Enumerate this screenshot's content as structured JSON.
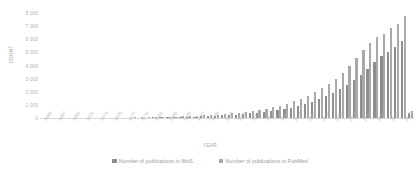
{
  "chart_data": {
    "type": "bar",
    "title": "",
    "xlabel": "YEAR",
    "ylabel": "COUNT",
    "ylim": [
      0,
      8000
    ],
    "ytick_values": [
      0,
      1000,
      2000,
      3000,
      4000,
      5000,
      6000,
      7000,
      8000
    ],
    "ytick_labels": [
      "0",
      "1 000",
      "2 000",
      "3 000",
      "4 000",
      "5 000",
      "6 000",
      "7 000",
      "8 000"
    ],
    "grid": false,
    "legend_position": "bottom",
    "categories": [
      "1965",
      "1966",
      "1967",
      "1968",
      "1969",
      "1970",
      "1971",
      "1972",
      "1973",
      "1974",
      "1975",
      "1976",
      "1977",
      "1978",
      "1979",
      "1980",
      "1981",
      "1982",
      "1983",
      "1984",
      "1985",
      "1986",
      "1987",
      "1988",
      "1989",
      "1990",
      "1991",
      "1992",
      "1993",
      "1994",
      "1995",
      "1996",
      "1997",
      "1998",
      "1999",
      "2000",
      "2001",
      "2002",
      "2003",
      "2004",
      "2005",
      "2006",
      "2007",
      "2008",
      "2009",
      "2010",
      "2011",
      "2012",
      "2013",
      "2014",
      "2015",
      "2016",
      "2017",
      "2018"
    ],
    "xtick_labels": [
      "1965",
      "1967",
      "1969",
      "1971",
      "1973",
      "1975",
      "1977",
      "1979",
      "1981",
      "1983",
      "1985",
      "1987",
      "1989",
      "1991",
      "1993",
      "1995",
      "1997",
      "1999",
      "2001",
      "2003",
      "2005",
      "2007",
      "2009",
      "2011",
      "2013",
      "2015",
      "2017"
    ],
    "series": [
      {
        "name": "Number of publications in WoS",
        "color": "#8e8e8e",
        "values": [
          2,
          3,
          4,
          5,
          6,
          8,
          9,
          11,
          13,
          15,
          18,
          21,
          24,
          28,
          33,
          38,
          45,
          52,
          60,
          70,
          82,
          95,
          110,
          128,
          148,
          172,
          198,
          228,
          262,
          300,
          345,
          395,
          450,
          515,
          590,
          680,
          790,
          915,
          1060,
          1230,
          1420,
          1640,
          1890,
          2180,
          2500,
          2860,
          3280,
          3760,
          4280,
          4700,
          5050,
          5400,
          5900,
          380
        ]
      },
      {
        "name": "Number of publications in PubMed",
        "color": "#a9a9a9",
        "values": [
          3,
          4,
          5,
          7,
          9,
          11,
          13,
          16,
          19,
          22,
          26,
          30,
          35,
          41,
          48,
          56,
          66,
          77,
          90,
          105,
          122,
          142,
          165,
          192,
          223,
          259,
          300,
          348,
          402,
          465,
          538,
          620,
          715,
          825,
          950,
          1095,
          1265,
          1460,
          1690,
          1950,
          2250,
          2600,
          3000,
          3460,
          3980,
          4560,
          5180,
          5720,
          6200,
          6400,
          6850,
          7200,
          7800,
          520
        ]
      }
    ]
  }
}
